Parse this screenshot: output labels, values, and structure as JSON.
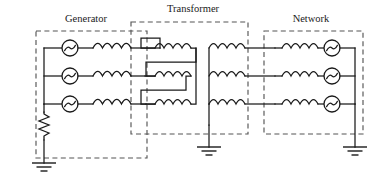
{
  "figure": {
    "type": "electrical-single-line-three-phase-schematic",
    "background_color": "#ffffff",
    "line_color": "#1a1a1a",
    "dash_box_color": "#555555",
    "width": 368,
    "height": 186
  },
  "blocks": [
    {
      "id": "generator",
      "label": "Generator",
      "label_x": 86,
      "label_y": 22,
      "box": {
        "x": 36,
        "y": 31,
        "w": 111,
        "h": 127
      },
      "phases": 3,
      "components_per_phase": [
        "ac-source",
        "inductor"
      ],
      "neutral": "resistor-grounded"
    },
    {
      "id": "transformer",
      "label": "Transformer",
      "label_x": 193,
      "label_y": 12,
      "box": {
        "x": 131,
        "y": 22,
        "w": 117,
        "h": 112
      },
      "primary_connection": "delta",
      "secondary_connection": "wye",
      "windings": 3,
      "neutral": "solidly-grounded"
    },
    {
      "id": "network",
      "label": "Network",
      "label_x": 311,
      "label_y": 22,
      "box": {
        "x": 264,
        "y": 31,
        "w": 99,
        "h": 103
      },
      "phases": 3,
      "components_per_phase": [
        "inductor",
        "ac-source"
      ],
      "neutral": "solidly-grounded"
    }
  ],
  "symbols": {
    "ac_source": "ac-voltage-source-icon",
    "inductor": "inductor-coil-icon",
    "resistor": "resistor-zigzag-icon",
    "ground": "earth-ground-icon"
  },
  "grounds": [
    {
      "id": "generator-ground",
      "x": 44,
      "y": 155
    },
    {
      "id": "transformer-ground",
      "x": 196,
      "y": 139
    },
    {
      "id": "network-ground",
      "x": 342,
      "y": 139
    }
  ],
  "phase_rows": [
    {
      "id": "phase-a",
      "y": 48
    },
    {
      "id": "phase-b",
      "y": 76
    },
    {
      "id": "phase-c",
      "y": 104
    }
  ]
}
